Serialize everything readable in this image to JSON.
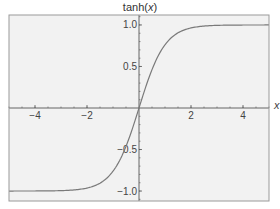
{
  "chart_data": {
    "type": "line",
    "title": "tanh(x)",
    "title_function": "tanh",
    "title_var": "x",
    "xlabel": "x",
    "ylabel": "",
    "xlim": [
      -5,
      5
    ],
    "ylim": [
      -1.12,
      1.12
    ],
    "xticks": [
      -4,
      -2,
      2,
      4
    ],
    "xtick_labels": [
      "−4",
      "−2",
      "2",
      "4"
    ],
    "yticks": [
      1.0,
      0.5,
      -0.5,
      -1.0
    ],
    "ytick_labels": [
      "1.0",
      "0.5",
      "−0.5",
      "−1.0"
    ],
    "x_minor_step": 0.5,
    "y_minor_step": 0.1,
    "grid": false,
    "legend": null,
    "series": [
      {
        "name": "tanh(x)",
        "function": "tanh",
        "x": [
          -5,
          -4,
          -3,
          -2.5,
          -2,
          -1.5,
          -1,
          -0.5,
          0,
          0.5,
          1,
          1.5,
          2,
          2.5,
          3,
          4,
          5
        ],
        "values": [
          -0.9999,
          -0.9993,
          -0.9951,
          -0.9866,
          -0.964,
          -0.9051,
          -0.7616,
          -0.4621,
          0,
          0.4621,
          0.7616,
          0.9051,
          0.964,
          0.9866,
          0.9951,
          0.9993,
          0.9999
        ]
      }
    ],
    "colors": {
      "plot_background": "#f2f2f2",
      "frame": "#9a9a9a",
      "axes": "#555555",
      "curve": "#7a7a7a"
    }
  }
}
